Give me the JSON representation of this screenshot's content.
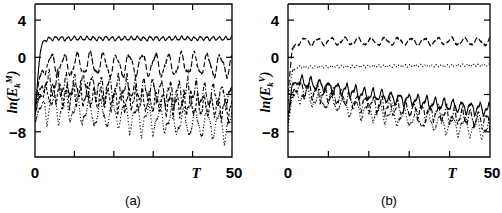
{
  "figure": {
    "panels": [
      {
        "id": "a",
        "caption": "(a)",
        "ylabel_prefix": "ln(E",
        "ylabel_sub": "k",
        "ylabel_sup": "M",
        "ylabel_suffix": ")",
        "xlabel": "T",
        "ytick_labels": [
          "4",
          "0",
          "−8"
        ],
        "xtick_labels": [
          "0",
          "50"
        ]
      },
      {
        "id": "b",
        "caption": "(b)",
        "ylabel_prefix": "ln(E",
        "ylabel_sub": "k",
        "ylabel_sup": "V",
        "ylabel_suffix": ")",
        "xlabel": "T",
        "ytick_labels": [
          "4",
          "0",
          "−8"
        ],
        "xtick_labels": [
          "0",
          "50"
        ]
      }
    ]
  },
  "chart_data": [
    {
      "type": "line",
      "panel": "a",
      "title": "(a)",
      "xlabel": "T",
      "ylabel": "ln(E_k^M)",
      "xlim": [
        0,
        50
      ],
      "ylim": [
        -12.5,
        5.5
      ],
      "xticks": [
        0,
        10,
        20,
        30,
        40,
        50
      ],
      "xtick_labels": [
        "0",
        "",
        "",
        "",
        "",
        "50"
      ],
      "yticks": [
        4,
        0,
        -8
      ],
      "ytick_labels": [
        "4",
        "0",
        "−8"
      ],
      "grid": false,
      "legend": "none",
      "series": [
        {
          "name": "k=1 (solid)",
          "style": "solid",
          "description": "Rapid growth from -6 to saturation near 2.0, then small-amplitude fast oscillation about 2.0",
          "x": [
            0,
            0.3,
            0.6,
            0.9,
            1.2,
            1.6,
            2.0,
            2.5,
            3.0,
            4,
            6,
            8,
            10,
            12,
            14,
            16,
            18,
            20,
            22,
            24,
            26,
            28,
            30,
            32,
            34,
            36,
            38,
            40,
            42,
            44,
            46,
            48,
            50
          ],
          "y": [
            -6.0,
            -4.4,
            -2.9,
            -1.3,
            0.1,
            1.1,
            1.6,
            1.85,
            1.95,
            2.0,
            2.05,
            2.0,
            2.05,
            2.0,
            2.05,
            2.0,
            2.05,
            2.0,
            2.05,
            2.0,
            2.05,
            2.0,
            2.05,
            2.0,
            2.05,
            2.0,
            2.05,
            2.0,
            2.05,
            2.0,
            2.05,
            2.0,
            2.05
          ],
          "oscillation_amplitude": 0.18,
          "oscillation_period": 1.6
        },
        {
          "name": "k=2 (long-dash)",
          "style": "dashed",
          "description": "Saturates near -0.6 with large oscillation touching 0 at peaks and -2.4 at troughs, period about 3.3",
          "x": [
            0,
            1,
            2,
            3,
            5,
            10,
            15,
            20,
            25,
            30,
            35,
            40,
            45,
            50
          ],
          "y": [
            -5.5,
            -2.4,
            -1.2,
            -0.8,
            -0.8,
            -0.8,
            -0.8,
            -0.8,
            -0.8,
            -0.8,
            -0.8,
            -0.8,
            -0.8,
            -0.8
          ],
          "oscillation_amplitude": 1.05,
          "oscillation_period": 3.3
        },
        {
          "name": "k=3 (dash-dot)",
          "style": "dashdot",
          "description": "Mean near -3.2 with slow downward drift to -4.2, oscillation amplitude about 1.3, period about 2.2",
          "x": [
            0,
            1,
            2,
            3,
            5,
            10,
            15,
            20,
            25,
            30,
            35,
            40,
            45,
            50
          ],
          "y": [
            -5.8,
            -3.6,
            -3.0,
            -2.9,
            -3.0,
            -3.1,
            -3.2,
            -3.3,
            -3.5,
            -3.6,
            -3.8,
            -3.9,
            -4.1,
            -4.3
          ],
          "oscillation_amplitude": 1.3,
          "oscillation_period": 2.2
        },
        {
          "name": "k=4 (short-dash)",
          "style": "dashed-short",
          "description": "Mean near -4.0 drifting down to -5.4, oscillation amplitude about 1.2, period about 1.7",
          "x": [
            0,
            1,
            2,
            3,
            5,
            10,
            15,
            20,
            25,
            30,
            35,
            40,
            45,
            50
          ],
          "y": [
            -6.2,
            -4.4,
            -3.9,
            -3.8,
            -3.9,
            -4.1,
            -4.3,
            -4.5,
            -4.6,
            -4.8,
            -5.0,
            -5.1,
            -5.3,
            -5.5
          ],
          "oscillation_amplitude": 1.2,
          "oscillation_period": 1.75
        },
        {
          "name": "k=5 (dotted)",
          "style": "dotted",
          "description": "Mean near -5.4 drifting down to -7.2, large oscillation amplitude about 1.6, period about 3.0",
          "x": [
            0,
            1,
            2,
            3,
            5,
            10,
            15,
            20,
            25,
            30,
            35,
            40,
            45,
            50
          ],
          "y": [
            -7.0,
            -5.6,
            -5.2,
            -5.2,
            -5.3,
            -5.6,
            -5.9,
            -6.1,
            -6.4,
            -6.6,
            -6.8,
            -7.0,
            -7.2,
            -7.4
          ],
          "oscillation_amplitude": 1.6,
          "oscillation_period": 3.0
        }
      ]
    },
    {
      "type": "line",
      "panel": "b",
      "title": "(b)",
      "xlabel": "T",
      "ylabel": "ln(E_k^V)",
      "xlim": [
        0,
        50
      ],
      "ylim": [
        -12.5,
        5.5
      ],
      "xticks": [
        0,
        10,
        20,
        30,
        40,
        50
      ],
      "xtick_labels": [
        "0",
        "",
        "",
        "",
        "",
        "50"
      ],
      "yticks": [
        4,
        0,
        -8
      ],
      "ytick_labels": [
        "4",
        "0",
        "−8"
      ],
      "grid": false,
      "legend": "none",
      "series": [
        {
          "name": "k=1 (long-dash)",
          "style": "dashed",
          "description": "Flat near 1.7 with shallow ripple amplitude about 0.35, period about 3.3",
          "x": [
            0,
            1,
            2,
            3,
            5,
            10,
            15,
            20,
            25,
            30,
            35,
            40,
            45,
            50
          ],
          "y": [
            -4.0,
            0.8,
            1.5,
            1.7,
            1.7,
            1.7,
            1.7,
            1.7,
            1.7,
            1.7,
            1.7,
            1.7,
            1.7,
            1.7
          ],
          "oscillation_amplitude": 0.35,
          "oscillation_period": 3.3
        },
        {
          "name": "k=2 (dotted)",
          "style": "dotted",
          "description": "Nearly flat near -1.0, very small ripple, slight rise toward -0.85",
          "x": [
            0,
            1,
            2,
            3,
            5,
            10,
            15,
            20,
            25,
            30,
            35,
            40,
            45,
            50
          ],
          "y": [
            -5.0,
            -1.6,
            -1.1,
            -1.05,
            -1.05,
            -1.0,
            -1.0,
            -0.95,
            -0.95,
            -0.9,
            -0.9,
            -0.9,
            -0.85,
            -0.85
          ],
          "oscillation_amplitude": 0.12,
          "oscillation_period": 1.3
        },
        {
          "name": "k=3 (solid)",
          "style": "solid",
          "description": "Starts near -2.6, decays slowly to -5.6, sawtooth oscillation amplitude about 0.65, period about 2.2",
          "x": [
            0,
            1,
            2,
            3,
            5,
            10,
            15,
            20,
            25,
            30,
            35,
            40,
            45,
            50
          ],
          "y": [
            -6.5,
            -3.0,
            -2.6,
            -2.6,
            -2.8,
            -3.2,
            -3.6,
            -4.0,
            -4.3,
            -4.6,
            -4.9,
            -5.2,
            -5.4,
            -5.7
          ],
          "oscillation_amplitude": 0.65,
          "oscillation_period": 2.2
        },
        {
          "name": "k=4 (dash-dot)",
          "style": "dashdot",
          "description": "Starts near -3.3 decaying to -6.6, oscillation amplitude about 0.9, period about 2.0",
          "x": [
            0,
            1,
            2,
            3,
            5,
            10,
            15,
            20,
            25,
            30,
            35,
            40,
            45,
            50
          ],
          "y": [
            -7.0,
            -3.8,
            -3.3,
            -3.3,
            -3.6,
            -4.1,
            -4.6,
            -5.0,
            -5.3,
            -5.6,
            -5.9,
            -6.2,
            -6.5,
            -6.8
          ],
          "oscillation_amplitude": 0.9,
          "oscillation_period": 2.0
        },
        {
          "name": "k=5 (dotted-lower)",
          "style": "dotted",
          "description": "Starts near -3.9 decaying to -7.6, oscillation amplitude about 1.0, period about 3.0",
          "x": [
            0,
            1,
            2,
            3,
            5,
            10,
            15,
            20,
            25,
            30,
            35,
            40,
            45,
            50
          ],
          "y": [
            -7.6,
            -4.3,
            -3.9,
            -3.9,
            -4.2,
            -4.8,
            -5.3,
            -5.8,
            -6.2,
            -6.5,
            -6.9,
            -7.2,
            -7.5,
            -7.8
          ],
          "oscillation_amplitude": 1.0,
          "oscillation_period": 3.0
        }
      ]
    }
  ]
}
